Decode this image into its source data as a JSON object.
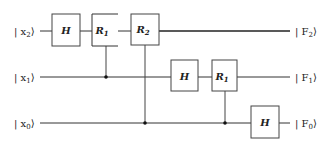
{
  "diagram": {
    "type": "quantum-circuit",
    "colors": {
      "line": "#333333",
      "box_border": "#444444",
      "background": "#ffffff",
      "dot": "#111111"
    },
    "inputs": [
      {
        "id": "x2",
        "label": "| x",
        "sub": "2",
        "close": "⟩",
        "y": 31
      },
      {
        "id": "x1",
        "label": "| x",
        "sub": "1",
        "close": "⟩",
        "y": 77
      },
      {
        "id": "x0",
        "label": "| x",
        "sub": "0",
        "close": "⟩",
        "y": 123
      }
    ],
    "outputs": [
      {
        "id": "F2",
        "label": "| F",
        "sub": "2",
        "close": "⟩",
        "y": 31
      },
      {
        "id": "F1",
        "label": "| F",
        "sub": "1",
        "close": "⟩",
        "y": 77
      },
      {
        "id": "F0",
        "label": "| F",
        "sub": "0",
        "close": "⟩",
        "y": 123
      }
    ],
    "gates": [
      {
        "id": "g1",
        "name": "H",
        "sub": "",
        "wire": "x2",
        "x": 52,
        "y": 14,
        "w": 28,
        "h": 32
      },
      {
        "id": "g2",
        "name": "R",
        "sub": "1",
        "wire": "x2",
        "x": 92,
        "y": 14,
        "w": 26,
        "h": 32,
        "control": "x1",
        "open_right": true
      },
      {
        "id": "g3",
        "name": "R",
        "sub": "2",
        "wire": "x2",
        "x": 131,
        "y": 14,
        "w": 28,
        "h": 31,
        "control": "x0"
      },
      {
        "id": "g4",
        "name": "H",
        "sub": "",
        "wire": "x1",
        "x": 171,
        "y": 60,
        "w": 27,
        "h": 31
      },
      {
        "id": "g5",
        "name": "R",
        "sub": "1",
        "wire": "x1",
        "x": 212,
        "y": 60,
        "w": 25,
        "h": 31,
        "control": "x0"
      },
      {
        "id": "g6",
        "name": "H",
        "sub": "",
        "wire": "x0",
        "x": 251,
        "y": 106,
        "w": 28,
        "h": 32
      }
    ],
    "controls": [
      {
        "gate": "g2",
        "x": 106,
        "from_y": 46,
        "to_y": 77
      },
      {
        "gate": "g3",
        "x": 145,
        "from_y": 45,
        "to_y": 123
      },
      {
        "gate": "g5",
        "x": 225,
        "from_y": 91,
        "to_y": 123
      }
    ]
  }
}
